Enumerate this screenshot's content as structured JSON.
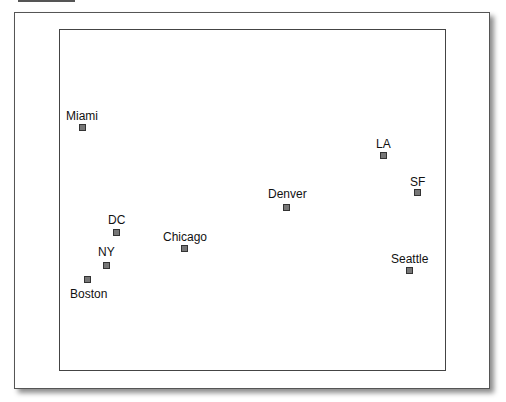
{
  "diagram": {
    "type": "point-map",
    "colors": {
      "marker_fill": "#777777",
      "marker_border": "#333333",
      "frame": "#444444"
    },
    "points": [
      {
        "name": "Miami",
        "label_x": 66,
        "label_y": 110,
        "marker_x": 79,
        "marker_y": 124
      },
      {
        "name": "LA",
        "label_x": 376,
        "label_y": 138,
        "marker_x": 380,
        "marker_y": 152
      },
      {
        "name": "SF",
        "label_x": 410,
        "label_y": 176,
        "marker_x": 414,
        "marker_y": 189
      },
      {
        "name": "Denver",
        "label_x": 268,
        "label_y": 188,
        "marker_x": 283,
        "marker_y": 204
      },
      {
        "name": "DC",
        "label_x": 108,
        "label_y": 214,
        "marker_x": 113,
        "marker_y": 229
      },
      {
        "name": "Chicago",
        "label_x": 163,
        "label_y": 231,
        "marker_x": 181,
        "marker_y": 245
      },
      {
        "name": "NY",
        "label_x": 98,
        "label_y": 246,
        "marker_x": 103,
        "marker_y": 262
      },
      {
        "name": "Seattle",
        "label_x": 391,
        "label_y": 253,
        "marker_x": 406,
        "marker_y": 267
      },
      {
        "name": "Boston",
        "label_x": 70,
        "label_y": 288,
        "marker_x": 84,
        "marker_y": 276
      }
    ]
  }
}
